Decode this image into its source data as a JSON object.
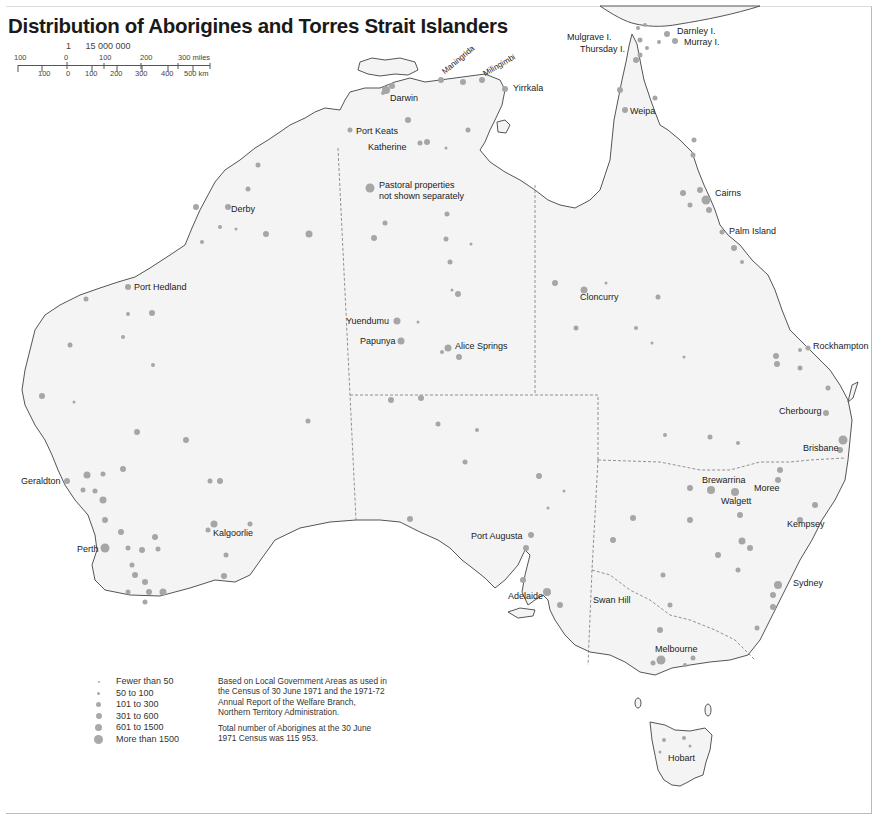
{
  "title": "Distribution of Aborigines and Torres Strait Islanders",
  "scale": {
    "ratio_num": "1",
    "ratio_den": "15 000 000",
    "miles_ticks": [
      "100",
      "0",
      "100",
      "200",
      "300 miles"
    ],
    "km_ticks": [
      "100",
      "0",
      "100",
      "200",
      "300",
      "400",
      "500 km"
    ]
  },
  "places": [
    {
      "name": "Darwin",
      "x": 390,
      "y": 95
    },
    {
      "name": "Maningrida",
      "x": 450,
      "y": 70,
      "rotate": -40
    },
    {
      "name": "Milingimbi",
      "x": 485,
      "y": 72,
      "rotate": -30
    },
    {
      "name": "Yirrkala",
      "x": 513,
      "y": 85
    },
    {
      "name": "Port Keats",
      "x": 356,
      "y": 129
    },
    {
      "name": "Katherine",
      "x": 368,
      "y": 145
    },
    {
      "name": "Pastoral properties",
      "x": 379,
      "y": 182
    },
    {
      "name": "not shown separately",
      "x": 379,
      "y": 193
    },
    {
      "name": "Mulgrave I.",
      "x": 568,
      "y": 34
    },
    {
      "name": "Thursday I.",
      "x": 580,
      "y": 46
    },
    {
      "name": "Darnley I.",
      "x": 677,
      "y": 28
    },
    {
      "name": "Murray I.",
      "x": 684,
      "y": 39
    },
    {
      "name": "Weipa",
      "x": 630,
      "y": 108
    },
    {
      "name": "Cairns",
      "x": 715,
      "y": 190
    },
    {
      "name": "Derby",
      "x": 231,
      "y": 206
    },
    {
      "name": "Palm Island",
      "x": 729,
      "y": 228
    },
    {
      "name": "Port Hedland",
      "x": 134,
      "y": 284
    },
    {
      "name": "Cloncurry",
      "x": 580,
      "y": 294
    },
    {
      "name": "Yuendumu",
      "x": 346,
      "y": 318
    },
    {
      "name": "Papunya",
      "x": 360,
      "y": 338
    },
    {
      "name": "Alice Springs",
      "x": 455,
      "y": 343
    },
    {
      "name": "Rockhampton",
      "x": 813,
      "y": 343
    },
    {
      "name": "Cherbourg",
      "x": 779,
      "y": 408
    },
    {
      "name": "Brisbane",
      "x": 803,
      "y": 445
    },
    {
      "name": "Geraldton",
      "x": 21,
      "y": 478
    },
    {
      "name": "Brewarrina",
      "x": 702,
      "y": 477
    },
    {
      "name": "Moree",
      "x": 754,
      "y": 484
    },
    {
      "name": "Walgett",
      "x": 721,
      "y": 497
    },
    {
      "name": "Kalgoorlie",
      "x": 213,
      "y": 530
    },
    {
      "name": "Kempsey",
      "x": 787,
      "y": 521
    },
    {
      "name": "Perth",
      "x": 77,
      "y": 546
    },
    {
      "name": "Port Augusta",
      "x": 471,
      "y": 533
    },
    {
      "name": "Sydney",
      "x": 793,
      "y": 580
    },
    {
      "name": "Adelaide",
      "x": 508,
      "y": 593
    },
    {
      "name": "Swan Hill",
      "x": 593,
      "y": 597
    },
    {
      "name": "Melbourne",
      "x": 655,
      "y": 646
    },
    {
      "name": "Hobart",
      "x": 668,
      "y": 755
    }
  ],
  "legend": {
    "items": [
      {
        "label": "Fewer than 50",
        "size": 2
      },
      {
        "label": "50 to 100",
        "size": 3
      },
      {
        "label": "101 to 300",
        "size": 5
      },
      {
        "label": "301 to 600",
        "size": 6
      },
      {
        "label": "601 to 1500",
        "size": 7
      },
      {
        "label": "More than 1500",
        "size": 9
      }
    ]
  },
  "notes": {
    "source": "Based on Local Government Areas as used in the Census of 30 June 1971 and the 1971-72 Annual Report of the Welfare Branch, Northern Territory Administration.",
    "total": "Total number of Aborigines at the 30 June 1971 Census was 115 953."
  },
  "colors": {
    "land": "#f4f4f4",
    "coast": "#555555",
    "dot": "#a6a6a6",
    "border": "#777777"
  }
}
